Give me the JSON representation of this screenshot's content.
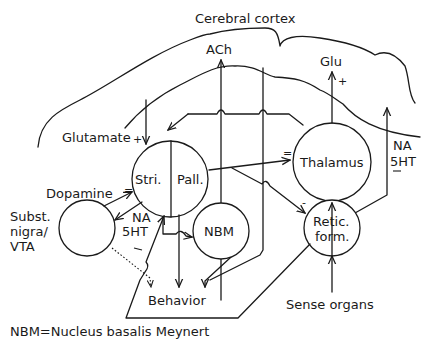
{
  "diagram": {
    "title_region": "Cerebral cortex",
    "nodes": {
      "striatum": "Stri.",
      "pallidum": "Pall.",
      "thalamus": "Thalamus",
      "nbm": "NBM",
      "retic_line1": "Retic.",
      "retic_line2": "form.",
      "subst_line1": "Subst.",
      "subst_line2": "nigra/",
      "subst_line3": "VTA"
    },
    "transmitters": {
      "ach": "ACh",
      "glu": "Glu",
      "glu_sign": "+",
      "glutamate": "Glutamate",
      "glutamate_sign": "+",
      "dopamine": "Dopamine",
      "dopamine_sign": "=",
      "na_left": "NA",
      "ht_left": "5HT",
      "na_right": "NA",
      "ht_right": "5HT",
      "pall_thal_sign": "=",
      "retic_sign": "-"
    },
    "outputs": {
      "behavior": "Behavior",
      "sense_organs": "Sense organs"
    },
    "legend": {
      "abbreviation": "NBM=Nucleus basalis Meynert"
    }
  }
}
